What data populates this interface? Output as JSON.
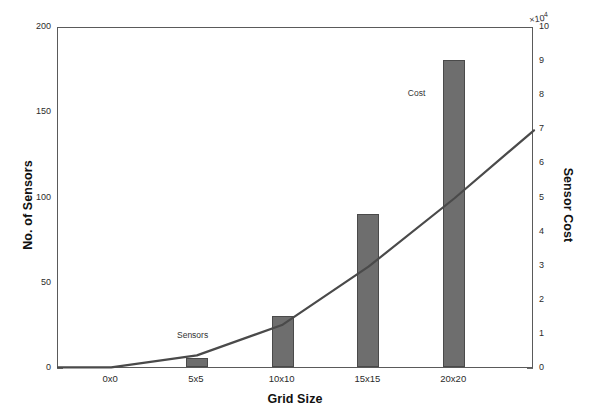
{
  "chart_data": {
    "type": "bar",
    "title": "",
    "xlabel": "Grid Size",
    "ylabel": "No. of Sensors",
    "y2label": "Sensor Cost",
    "y2_multiplier": "×10",
    "y2_multiplier_exp": "4",
    "categories": [
      "0x0",
      "5x5",
      "10x10",
      "15x15",
      "20x20"
    ],
    "x_tick_labels": [
      "0x0",
      "5x5",
      "10x10",
      "15x15",
      "20x20"
    ],
    "y_tick_labels": [
      "0",
      "50",
      "100",
      "150",
      "200"
    ],
    "y_ticks": [
      0,
      50,
      100,
      150,
      200
    ],
    "ylim": [
      0,
      200
    ],
    "y2_tick_labels": [
      "0",
      "1",
      "2",
      "3",
      "4",
      "5",
      "6",
      "7",
      "8",
      "9",
      "10"
    ],
    "y2_ticks": [
      0,
      1,
      2,
      3,
      4,
      5,
      6,
      7,
      8,
      9,
      10
    ],
    "y2lim": [
      0,
      10
    ],
    "grid": false,
    "legend_position": "inline-annotations",
    "series": [
      {
        "name": "Sensors",
        "type": "bar",
        "axis": "left",
        "categories": [
          "0x0",
          "5x5",
          "10x10",
          "15x15",
          "20x20"
        ],
        "values": [
          0,
          5,
          30,
          90,
          180
        ],
        "color": "#6e6e6e",
        "annotation": "Sensors"
      },
      {
        "name": "Cost",
        "type": "line",
        "axis": "right",
        "x": [
          "0x0",
          "5x5",
          "10x10",
          "15x15",
          "20x20",
          "end"
        ],
        "values": [
          0.05,
          0.4,
          1.3,
          3.0,
          5.0,
          7.0
        ],
        "color": "#4a4a4a",
        "annotation": "Cost"
      }
    ],
    "annotations": [
      {
        "text": "Sensors",
        "x_frac": 0.25,
        "y_frac": 0.885
      },
      {
        "text": "Cost",
        "x_frac": 0.735,
        "y_frac": 0.175
      }
    ]
  },
  "axes": {
    "left_title": "No. of Sensors",
    "right_title": "Sensor Cost",
    "bottom_title": "Grid Size",
    "exponent_prefix": "×10",
    "exponent_power": "4"
  },
  "colors": {
    "bar_fill": "#6e6e6e",
    "bar_edge": "#4a4a4a",
    "line": "#4a4a4a",
    "axis": "#5a5a5a",
    "background": "#ffffff",
    "text": "#1a1a1a"
  }
}
